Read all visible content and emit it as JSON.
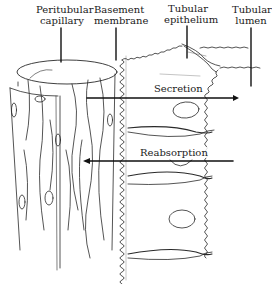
{
  "diagram": {
    "labels": {
      "peritubular_capillary": [
        "Peritubular",
        "capillary"
      ],
      "basement_membrane": [
        "Basement",
        "membrane"
      ],
      "tubular_epithelium": [
        "Tubular",
        "epithelium"
      ],
      "tubular_lumen": [
        "Tubular",
        "lumen"
      ]
    },
    "arrows": {
      "secretion": {
        "label": "Secretion",
        "direction": "capillary-to-lumen"
      },
      "reabsorption": {
        "label": "Reabsorption",
        "direction": "lumen-to-capillary"
      }
    },
    "colors": {
      "ink": "#1a1a1a",
      "background": "#ffffff"
    }
  }
}
